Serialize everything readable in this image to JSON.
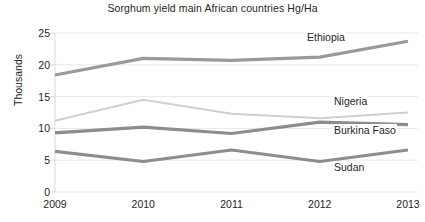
{
  "chart_data": {
    "type": "line",
    "title": "Sorghum yield main African countries Hg/Ha",
    "xlabel": "",
    "ylabel": "Thousands",
    "categories": [
      "2009",
      "2010",
      "2011",
      "2012",
      "2013"
    ],
    "x": [
      2009,
      2010,
      2011,
      2012,
      2013
    ],
    "ylim": [
      0,
      25
    ],
    "yticks": [
      "0",
      "5",
      "10",
      "15",
      "20",
      "25"
    ],
    "ytick_values": [
      0,
      5,
      10,
      15,
      20,
      25
    ],
    "grid": "horizontal",
    "legend_position": "inline-right-of-series",
    "series": [
      {
        "name": "Ethiopia",
        "values": [
          18.4,
          21.0,
          20.7,
          21.2,
          23.7
        ],
        "color": "#9a9a9a",
        "width": 3.2
      },
      {
        "name": "Nigeria",
        "values": [
          11.2,
          14.5,
          12.3,
          11.6,
          12.5
        ],
        "color": "#cfcfcf",
        "width": 2.2
      },
      {
        "name": "Burkina Faso",
        "values": [
          9.3,
          10.2,
          9.2,
          11.0,
          10.6
        ],
        "color": "#8d8d8d",
        "width": 3.2
      },
      {
        "name": "Sudan",
        "values": [
          6.4,
          4.8,
          6.6,
          4.8,
          6.6
        ],
        "color": "#8d8d8d",
        "width": 3.2
      }
    ],
    "annotations": [
      {
        "text": "Ethiopia",
        "x": 306,
        "y": 31
      },
      {
        "text": "Nigeria",
        "x": 333,
        "y": 95
      },
      {
        "text": "Burkina Faso",
        "x": 333,
        "y": 124
      },
      {
        "text": "Sudan",
        "x": 333,
        "y": 161
      }
    ],
    "colors": {
      "axis": "#d9d9d9",
      "grid": "#e8e8e8",
      "text": "#262626",
      "background": "#ffffff"
    }
  }
}
